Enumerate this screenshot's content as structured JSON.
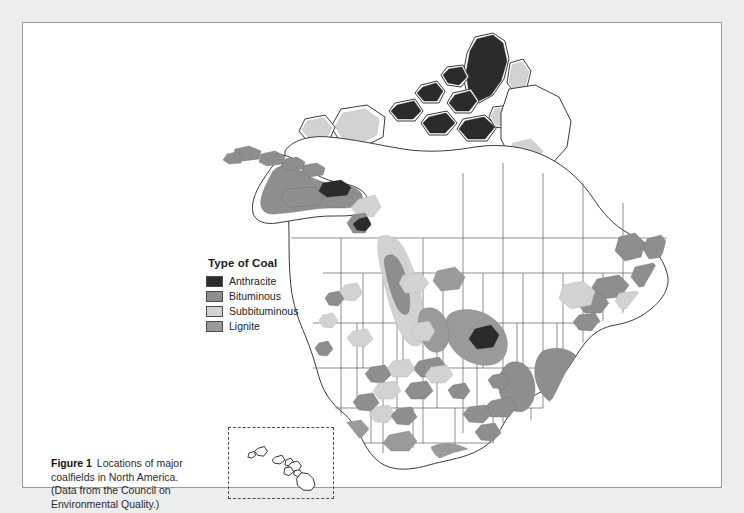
{
  "figure": {
    "caption_label": "Figure 1",
    "caption_text": "Locations of major coalfields in North America. (Data from the Council on Environmental Quality.)",
    "background_color": "#eceded",
    "panel_color": "#ffffff",
    "panel_border_color": "#9a9a9a"
  },
  "legend": {
    "title": "Type of Coal",
    "items": [
      {
        "label": "Anthracite",
        "color": "#2b2b2b"
      },
      {
        "label": "Bituminous",
        "color": "#8e8e8e"
      },
      {
        "label": "Subbituminous",
        "color": "#d2d2d2"
      },
      {
        "label": "Lignite",
        "color": "#9a9a9a"
      }
    ]
  },
  "map": {
    "region": "North America",
    "coastline_color": "#3c3c3c",
    "border_color": "#555555",
    "land_color": "#ffffff",
    "inset": {
      "name": "Hawaii",
      "border_style": "dashed"
    },
    "coal_regions": [
      {
        "name": "Canadian Arctic Archipelago",
        "type": "Anthracite"
      },
      {
        "name": "Ellesmere Island",
        "type": "Anthracite"
      },
      {
        "name": "Pennsylvania Anthracite",
        "type": "Anthracite"
      },
      {
        "name": "Appalachian Basin",
        "type": "Bituminous"
      },
      {
        "name": "Illinois Basin",
        "type": "Bituminous"
      },
      {
        "name": "Western Interior Basin",
        "type": "Bituminous"
      },
      {
        "name": "Alberta Plains",
        "type": "Subbituminous"
      },
      {
        "name": "Powder River Basin",
        "type": "Lignite"
      },
      {
        "name": "Fort Union Region",
        "type": "Lignite"
      },
      {
        "name": "Gulf Coast Lignite Belt",
        "type": "Lignite"
      },
      {
        "name": "Alaska North Slope",
        "type": "Bituminous"
      },
      {
        "name": "Maritimes / Nova Scotia",
        "type": "Bituminous"
      }
    ]
  }
}
